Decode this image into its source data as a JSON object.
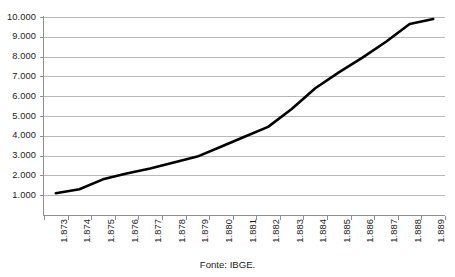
{
  "caption": "Fonte: IBGE.",
  "axis": {
    "y_ticks": [
      "10.000",
      "9.000",
      "8.000",
      "7.000",
      "6.000",
      "5.000",
      "4.000",
      "3.000",
      "2.000",
      "1.000"
    ],
    "x_ticks": [
      "1.873",
      "1.874",
      "1.875",
      "1.876",
      "1.877",
      "1.878",
      "1.879",
      "1.880",
      "1.881",
      "1.882",
      "1.883",
      "1.884",
      "1.885",
      "1.886",
      "1.887",
      "1.888",
      "1.889"
    ]
  },
  "style": {
    "line_color": "#000000",
    "grid_color": "#b9b9b9",
    "axis_color": "#8f8f8f",
    "background": "#ffffff"
  },
  "chart_data": {
    "type": "line",
    "title": "",
    "subtitle": "",
    "xlabel": "",
    "ylabel": "",
    "annotations": [
      "Fonte: IBGE."
    ],
    "legend": [],
    "legend_position": "none",
    "grid": true,
    "ylim": [
      0,
      10000
    ],
    "ytick_interval": 1000,
    "ytick_labels": [
      "1.000",
      "2.000",
      "3.000",
      "4.000",
      "5.000",
      "6.000",
      "7.000",
      "8.000",
      "9.000",
      "10.000"
    ],
    "categories": [
      "1.873",
      "1.874",
      "1.875",
      "1.876",
      "1.877",
      "1.878",
      "1.879",
      "1.880",
      "1.881",
      "1.882",
      "1.883",
      "1.884",
      "1.885",
      "1.886",
      "1.887",
      "1.888",
      "1.889"
    ],
    "values": [
      1100,
      1300,
      1800,
      2100,
      2350,
      2650,
      2950,
      3450,
      3950,
      4450,
      5350,
      6400,
      7200,
      7950,
      8750,
      9650,
      9900
    ]
  }
}
